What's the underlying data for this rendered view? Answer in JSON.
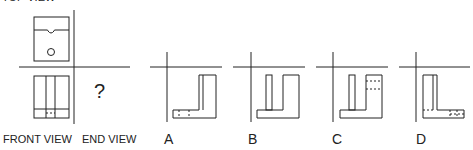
{
  "labels": {
    "top_view": "TOP VIEW",
    "front_view": "FRONT VIEW",
    "end_view": "END VIEW",
    "question_mark": "?"
  },
  "options": [
    {
      "letter": "A"
    },
    {
      "letter": "B"
    },
    {
      "letter": "C"
    },
    {
      "letter": "D"
    }
  ],
  "colors": {
    "line": "#222222",
    "background": "#ffffff"
  }
}
